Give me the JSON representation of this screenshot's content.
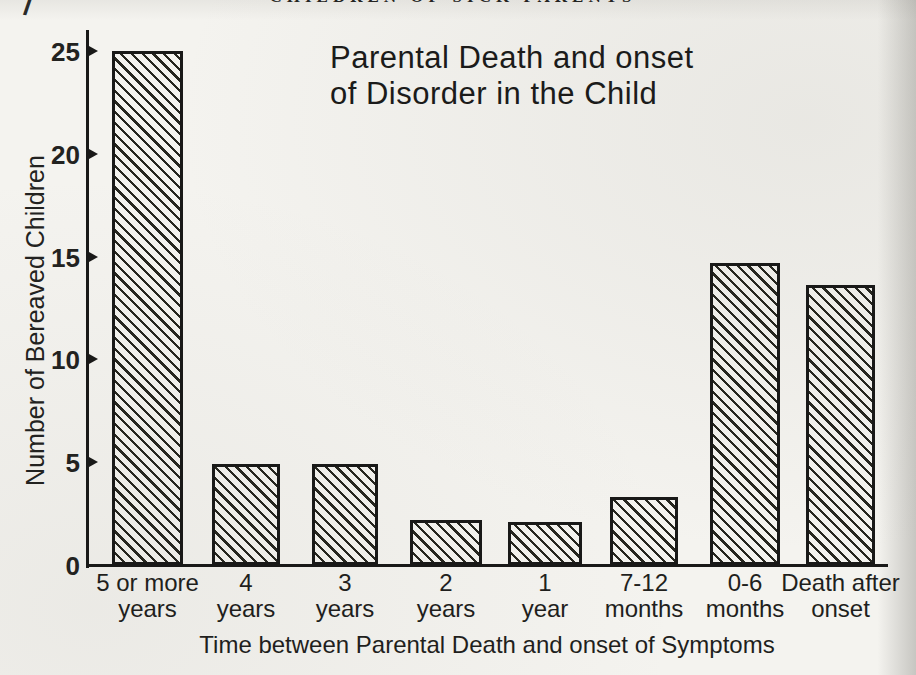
{
  "page": {
    "running_header": "CHILDREN OF SICK PARENTS",
    "corner_mark": "/"
  },
  "chart_data": {
    "type": "bar",
    "title_line1": "Parental Death and onset",
    "title_line2": "of Disorder in the Child",
    "ylabel": "Number of Bereaved Children",
    "xlabel": "Time between Parental Death and onset of Symptoms",
    "ylim": [
      0,
      26
    ],
    "yticks": [
      25,
      20,
      15,
      10,
      5,
      0
    ],
    "grid": "off",
    "legend": "none",
    "bar_style": "diagonal-hatch",
    "categories": [
      {
        "line1": "5 or more",
        "line2": "years"
      },
      {
        "line1": "4",
        "line2": "years"
      },
      {
        "line1": "3",
        "line2": "years"
      },
      {
        "line1": "2",
        "line2": "years"
      },
      {
        "line1": "1",
        "line2": "year"
      },
      {
        "line1": "7-12",
        "line2": "months"
      },
      {
        "line1": "0-6",
        "line2": "months"
      },
      {
        "line1": "Death after",
        "line2": "onset"
      }
    ],
    "values": [
      25,
      4.9,
      4.9,
      2.2,
      2.1,
      3.3,
      14.7,
      13.6
    ]
  }
}
